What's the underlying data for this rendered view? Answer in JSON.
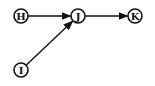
{
  "diagram": {
    "type": "directed-graph",
    "nodes": [
      {
        "id": "H",
        "label": "H"
      },
      {
        "id": "J",
        "label": "J"
      },
      {
        "id": "K",
        "label": "K"
      },
      {
        "id": "I",
        "label": "I"
      }
    ],
    "edges": [
      {
        "from": "H",
        "to": "J"
      },
      {
        "from": "J",
        "to": "K"
      },
      {
        "from": "I",
        "to": "J"
      }
    ]
  }
}
